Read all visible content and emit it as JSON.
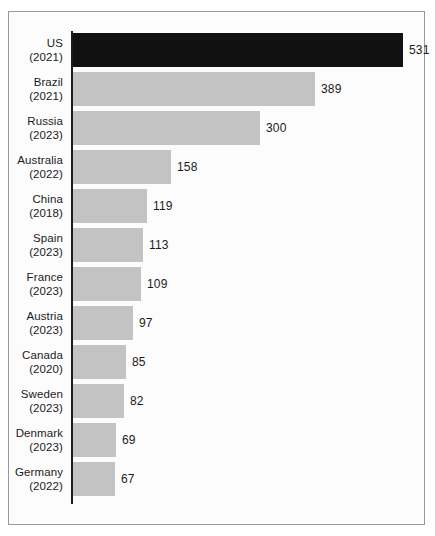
{
  "chart_data": {
    "type": "bar",
    "orientation": "horizontal",
    "title": "",
    "subtitle": "",
    "xlabel": "",
    "ylabel": "",
    "grid": false,
    "legend": false,
    "axis_visible": {
      "category_axis": true,
      "value_axis": false
    },
    "xlim": [
      0,
      531
    ],
    "categories": [
      "US (2021)",
      "Brazil (2021)",
      "Russia (2023)",
      "Australia (2022)",
      "China (2018)",
      "Spain (2023)",
      "France (2023)",
      "Austria (2023)",
      "Canada (2020)",
      "Sweden (2023)",
      "Denmark (2023)",
      "Germany (2022)"
    ],
    "values": [
      531,
      389,
      300,
      158,
      119,
      113,
      109,
      97,
      85,
      82,
      69,
      67
    ],
    "bars": [
      {
        "name": "US",
        "year": "(2021)",
        "value": 531,
        "label": "531",
        "highlight": true
      },
      {
        "name": "Brazil",
        "year": "(2021)",
        "value": 389,
        "label": "389",
        "highlight": false
      },
      {
        "name": "Russia",
        "year": "(2023)",
        "value": 300,
        "label": "300",
        "highlight": false
      },
      {
        "name": "Australia",
        "year": "(2022)",
        "value": 158,
        "label": "158",
        "highlight": false
      },
      {
        "name": "China",
        "year": "(2018)",
        "value": 119,
        "label": "119",
        "highlight": false
      },
      {
        "name": "Spain",
        "year": "(2023)",
        "value": 113,
        "label": "113",
        "highlight": false
      },
      {
        "name": "France",
        "year": "(2023)",
        "value": 109,
        "label": "109",
        "highlight": false
      },
      {
        "name": "Austria",
        "year": "(2023)",
        "value": 97,
        "label": "97",
        "highlight": false
      },
      {
        "name": "Canada",
        "year": "(2020)",
        "value": 85,
        "label": "85",
        "highlight": false
      },
      {
        "name": "Sweden",
        "year": "(2023)",
        "value": 82,
        "label": "82",
        "highlight": false
      },
      {
        "name": "Denmark",
        "year": "(2023)",
        "value": 69,
        "label": "69",
        "highlight": false
      },
      {
        "name": "Germany",
        "year": "(2022)",
        "value": 67,
        "label": "67",
        "highlight": false
      }
    ],
    "colors": {
      "bar": "#c3c3c3",
      "bar_highlight": "#111111",
      "axis": "#1b1b1b",
      "text": "#1b1b1b",
      "frame": "#9a9a9a",
      "background": "#fcfcfc"
    },
    "geometry": {
      "bar_height_px": 34,
      "bar_pitch_px": 39,
      "first_bar_top_px": 21,
      "axis_x_px": 62,
      "px_per_unit": 0.622,
      "value_label_gap_px": 6
    }
  }
}
